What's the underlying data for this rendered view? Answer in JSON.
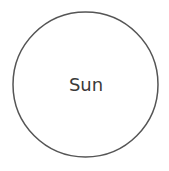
{
  "diagram": {
    "nodes": [
      {
        "id": "sun",
        "label": "Sun",
        "shape": "circle",
        "cx": 85.5,
        "cy": 84.5,
        "r": 72.5,
        "stroke": "#555555",
        "fill": "#ffffff"
      }
    ],
    "edges": []
  }
}
